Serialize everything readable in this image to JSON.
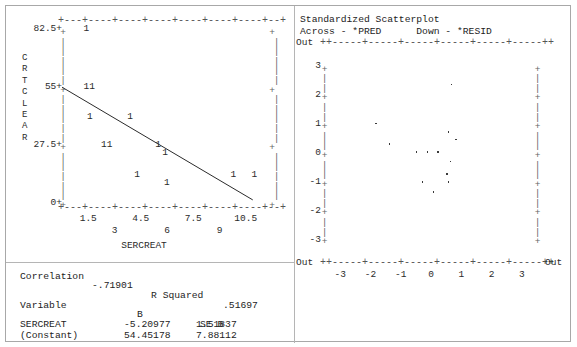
{
  "colors": {
    "ink": "#2b2b2b",
    "axis": "#666666",
    "frame": "#a8a8a8",
    "divider": "#b5b5b5",
    "background": "#ffffff"
  },
  "left_plot": {
    "y_axis_title": "CRTCLEAR",
    "y_axis_title_chars": [
      "C",
      "R",
      "T",
      "C",
      "L",
      "E",
      "A",
      "R"
    ],
    "x_axis_title": "SERCREAT",
    "y_ticks": [
      "82.5+",
      "55+",
      "27.5+",
      "0+"
    ],
    "x_ticks_upper": [
      "1.5",
      "4.5",
      "7.5",
      "10.5"
    ],
    "x_ticks_lower": [
      "3",
      "6",
      "9"
    ],
    "axis_rule": "+---+----+----+----+----+----+----+--+",
    "rail_tick": "+",
    "rail_dash": "|",
    "marker_single": "1",
    "marker_double": "11"
  },
  "right_plot": {
    "title": "Standardized Scatterplot",
    "across_label": "Across - *PRED",
    "down_label": "Down - *RESID",
    "out_label": "Out",
    "y_ticks": [
      "3",
      "2",
      "1",
      "0",
      "-1",
      "-2",
      "-3"
    ],
    "x_ticks": [
      "-3",
      "-2",
      "-1",
      "0",
      "1",
      "2",
      "3"
    ],
    "axis_rule": "++-----+-----+-----+-----+-----+-----++",
    "rail_tick": "+",
    "rail_dash": "|"
  },
  "stats": {
    "correlation_label": "Correlation",
    "correlation_value": "-.71901",
    "r_squared_label": "R Squared",
    "r_squared_value": ".51697",
    "header_variable": "Variable",
    "header_b": "B",
    "header_se_b": "SE B",
    "rows": [
      {
        "variable": "SERCREAT",
        "b": "-5.20977",
        "se_b": "1.51837"
      },
      {
        "variable": "(Constant)",
        "b": "54.45178",
        "se_b": "7.88112"
      }
    ]
  },
  "chart_data": [
    {
      "type": "scatter",
      "title": "",
      "xlabel": "SERCREAT",
      "ylabel": "CRTCLEAR",
      "xlim": [
        0,
        12
      ],
      "ylim": [
        0,
        82.5
      ],
      "grid": false,
      "legend": "none",
      "marker_labels": "counts",
      "notes": "ASCII scatterplot; digit at each cell is the number of overlapping cases. A fitted least-squares regression line is overlaid.",
      "regression_line": {
        "slope": -5.20977,
        "intercept": 54.45178,
        "x_start": 0.0,
        "y_start": 54.45,
        "x_end": 10.9,
        "y_end": 1.0
      },
      "points": [
        {
          "x": 1.4,
          "y": 82.5,
          "count": 1,
          "label": "1"
        },
        {
          "x": 1.4,
          "y": 55.0,
          "count": 2,
          "label": "11"
        },
        {
          "x": 1.6,
          "y": 41.0,
          "count": 1,
          "label": "1"
        },
        {
          "x": 3.9,
          "y": 41.0,
          "count": 1,
          "label": "1"
        },
        {
          "x": 2.4,
          "y": 27.5,
          "count": 2,
          "label": "11"
        },
        {
          "x": 5.5,
          "y": 27.5,
          "count": 1,
          "label": "1"
        },
        {
          "x": 5.9,
          "y": 23.5,
          "count": 1,
          "label": "1"
        },
        {
          "x": 4.3,
          "y": 13.5,
          "count": 1,
          "label": "1"
        },
        {
          "x": 6.0,
          "y": 9.5,
          "count": 1,
          "label": "1"
        },
        {
          "x": 9.8,
          "y": 13.5,
          "count": 1,
          "label": "1"
        },
        {
          "x": 11.0,
          "y": 13.5,
          "count": 1,
          "label": "1"
        }
      ]
    },
    {
      "type": "scatter",
      "title": "Standardized Scatterplot",
      "xlabel": "*PRED",
      "ylabel": "*RESID",
      "xlim": [
        -3,
        3
      ],
      "ylim": [
        -3,
        3
      ],
      "grid": false,
      "legend": "none",
      "notes": "Standardized predicted value versus standardized residual. Axis ends are labelled 'Out' for out-of-range cases.",
      "points": [
        {
          "x": 0.65,
          "y": 2.35
        },
        {
          "x": -1.85,
          "y": 1.0
        },
        {
          "x": 0.55,
          "y": 0.72
        },
        {
          "x": -1.4,
          "y": 0.3
        },
        {
          "x": 0.8,
          "y": 0.45
        },
        {
          "x": -0.5,
          "y": 0.02
        },
        {
          "x": -0.15,
          "y": 0.02
        },
        {
          "x": 0.2,
          "y": 0.02
        },
        {
          "x": 0.62,
          "y": -0.3
        },
        {
          "x": 0.5,
          "y": -0.72
        },
        {
          "x": -0.3,
          "y": -1.0
        },
        {
          "x": 0.55,
          "y": -1.0
        },
        {
          "x": 0.05,
          "y": -1.35
        }
      ]
    }
  ]
}
